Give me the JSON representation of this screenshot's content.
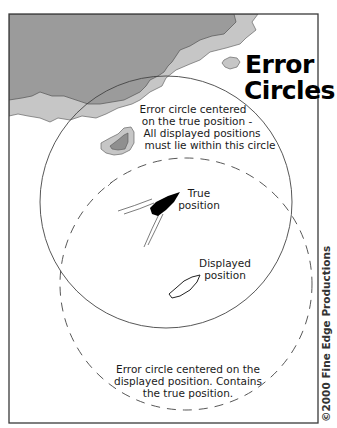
{
  "figure": {
    "title_lines": [
      "Error",
      "Circles"
    ],
    "copyright": "©2000 Fine Edge Productions",
    "colors": {
      "land_dark": "#9a9a9a",
      "land_light": "#c4c4c4",
      "outline": "#555555",
      "frame": "#3a3a3a",
      "boat_true": "#000000"
    }
  },
  "annotations": {
    "true_circle": {
      "lines": [
        "Error circle centered",
        "on the true position -",
        "All displayed positions",
        "must lie within this circle"
      ]
    },
    "true_position": {
      "lines": [
        "True",
        "position"
      ]
    },
    "displayed_position": {
      "lines": [
        "Displayed",
        "position"
      ]
    },
    "displayed_circle": {
      "lines": [
        "Error circle centered on the",
        "displayed position. Contains",
        "the true position."
      ]
    }
  },
  "circles": [
    {
      "name": "true-position-error-circle",
      "style": "solid",
      "cx": 166,
      "cy": 202,
      "r": 126
    },
    {
      "name": "displayed-position-error-circle",
      "style": "dashed",
      "cx": 186,
      "cy": 284,
      "r": 126
    }
  ]
}
